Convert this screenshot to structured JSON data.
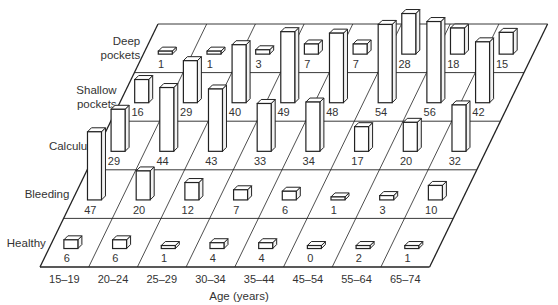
{
  "chart_data": {
    "type": "bar",
    "subtype": "3d-perspective-bar-grid",
    "title": "",
    "xlabel": "Age (years)",
    "ylabel": "",
    "categories": [
      "15–19",
      "20–24",
      "25–29",
      "30–34",
      "35–44",
      "45–54",
      "55–64",
      "65–74"
    ],
    "series": [
      {
        "name": "Deep pockets",
        "values": [
          1,
          1,
          3,
          7,
          7,
          28,
          18,
          15
        ]
      },
      {
        "name": "Shallow pockets",
        "values": [
          16,
          29,
          40,
          49,
          48,
          54,
          56,
          42
        ]
      },
      {
        "name": "Calculus",
        "values": [
          29,
          44,
          43,
          33,
          34,
          17,
          20,
          32
        ]
      },
      {
        "name": "Bleeding",
        "values": [
          47,
          20,
          12,
          7,
          6,
          1,
          3,
          10
        ]
      },
      {
        "name": "Healthy",
        "values": [
          6,
          6,
          1,
          4,
          4,
          0,
          2,
          1
        ]
      }
    ],
    "row_labels": [
      [
        "Deep",
        "pockets"
      ],
      [
        "Shallow",
        "pockets"
      ],
      [
        "Calculus"
      ],
      [
        "Bleeding"
      ],
      [
        "Healthy"
      ]
    ],
    "grid": true,
    "legend": "none",
    "colors": {
      "line": "#222222",
      "bar_front": "#ffffff",
      "bar_side": "#f2f2f2",
      "text": "#333333"
    }
  }
}
